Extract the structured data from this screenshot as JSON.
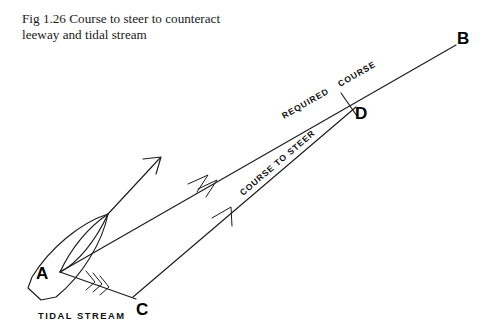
{
  "figure": {
    "caption": "Fig 1.26 Course to steer to counteract\nleeway and tidal stream",
    "caption_number": "Fig 1.26"
  },
  "diagram": {
    "type": "vector-triangle",
    "line_color": "#1c1c1c",
    "background": "#ffffff",
    "points": [
      {
        "id": "A",
        "label": "A",
        "x": 50,
        "y": 271,
        "role": "origin-vessel-position"
      },
      {
        "id": "B",
        "label": "B",
        "x": 463,
        "y": 37,
        "role": "destination"
      },
      {
        "id": "C",
        "label": "C",
        "x": 143,
        "y": 307,
        "role": "tidal-stream-endpoint"
      },
      {
        "id": "D",
        "label": "D",
        "x": 361,
        "y": 112,
        "role": "position-after-one-hour"
      }
    ],
    "vectors": [
      {
        "id": "required-course",
        "label": "REQUIRED COURSE",
        "label_parts": [
          "REQUIRED",
          "COURSE"
        ],
        "from": "A",
        "to": "B",
        "arrowheads": 2,
        "note": "ground track through D"
      },
      {
        "id": "course-to-steer",
        "label": "COURSE TO STEER",
        "from": "C",
        "to": "D",
        "arrowheads": 1,
        "note": "water track"
      },
      {
        "id": "tidal-stream",
        "label": "TIDAL STREAM",
        "from": "A",
        "to": "C",
        "arrowheads": 3,
        "note": "three feathers denote tidal stream"
      },
      {
        "id": "heading",
        "label": "",
        "from": "bow",
        "to": "heading-tip",
        "arrowheads": 1,
        "note": "vessel heading allowing for leeway"
      }
    ],
    "vessel": {
      "name": "boat-hull-outline",
      "note": "hull drawn at position A showing leeway angle"
    }
  }
}
